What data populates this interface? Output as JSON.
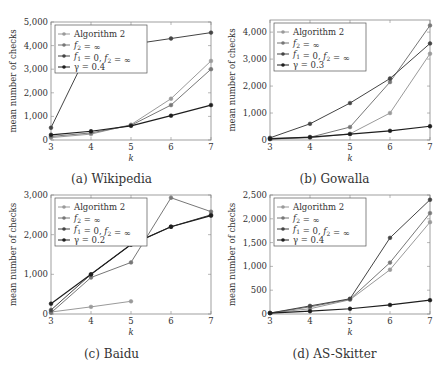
{
  "chart_data": [
    {
      "id": "a",
      "type": "line",
      "title": "(a) Wikipedia",
      "caption": "(a) Wikipedia",
      "xlabel": "k",
      "ylabel": "mean number of checks",
      "x": [
        3,
        4,
        5,
        6,
        7
      ],
      "xticks": [
        "3",
        "4",
        "5",
        "6",
        "7"
      ],
      "ylim": [
        0,
        5000
      ],
      "yticks": [
        0,
        1000,
        2000,
        3000,
        4000,
        5000
      ],
      "ytick_labels": [
        "0",
        "1,000",
        "2,000",
        "3,000",
        "4,000",
        "5,000"
      ],
      "legend_position": "upper left",
      "grid": false,
      "series": [
        {
          "name": "Algorithm 2",
          "color": "#9a9a9a",
          "values": [
            100,
            250,
            650,
            1750,
            3350
          ]
        },
        {
          "name": "f2 = ∞",
          "color": "#777777",
          "values": [
            150,
            300,
            620,
            1480,
            3000
          ]
        },
        {
          "name": "f1 = 0, f2 = ∞",
          "color": "#444444",
          "values": [
            520,
            4000,
            4050,
            4300,
            4550
          ]
        },
        {
          "name": "γ = 0.4",
          "color": "#1e1e1e",
          "values": [
            220,
            370,
            600,
            1030,
            1480
          ]
        }
      ]
    },
    {
      "id": "b",
      "type": "line",
      "title": "(b) Gowalla",
      "caption": "(b) Gowalla",
      "xlabel": "k",
      "ylabel": "mean number of checks",
      "x": [
        3,
        4,
        5,
        6,
        7
      ],
      "xticks": [
        "3",
        "4",
        "5",
        "6",
        "7"
      ],
      "ylim": [
        0,
        4450
      ],
      "yticks": [
        0,
        1000,
        2000,
        3000,
        4000
      ],
      "ytick_labels": [
        "0",
        "1,000",
        "2,000",
        "3,000",
        "4,000"
      ],
      "legend_position": "upper left",
      "grid": false,
      "series": [
        {
          "name": "Algorithm 2",
          "color": "#9a9a9a",
          "values": [
            30,
            80,
            230,
            1000,
            3200
          ]
        },
        {
          "name": "f2 = ∞",
          "color": "#777777",
          "values": [
            60,
            100,
            480,
            2150,
            4250
          ]
        },
        {
          "name": "f1 = 0, f2 = ∞",
          "color": "#444444",
          "values": [
            80,
            600,
            1370,
            2280,
            3580
          ]
        },
        {
          "name": "γ = 0.3",
          "color": "#1e1e1e",
          "values": [
            40,
            110,
            220,
            340,
            510
          ]
        }
      ]
    },
    {
      "id": "c",
      "type": "line",
      "title": "(c) Baidu",
      "caption": "(c) Baidu",
      "xlabel": "k",
      "ylabel": "mean number of checks",
      "x": [
        3,
        4,
        5,
        6,
        7
      ],
      "xticks": [
        "3",
        "4",
        "5",
        "6",
        "7"
      ],
      "ylim": [
        0,
        3000
      ],
      "yticks": [
        0,
        1000,
        2000,
        3000
      ],
      "ytick_labels": [
        "0",
        "1,000",
        "2,000",
        "3,000"
      ],
      "legend_position": "upper left",
      "grid": false,
      "series": [
        {
          "name": "Algorithm 2",
          "color": "#9a9a9a",
          "values": [
            50,
            180,
            320,
            null,
            null
          ]
        },
        {
          "name": "f2 = ∞",
          "color": "#777777",
          "values": [
            30,
            920,
            1300,
            2930,
            2580
          ]
        },
        {
          "name": "f1 = 0, f2 = ∞",
          "color": "#444444",
          "values": [
            100,
            1000,
            1750,
            2200,
            2500
          ]
        },
        {
          "name": "γ = 0.2",
          "color": "#1e1e1e",
          "values": [
            260,
            1000,
            1750,
            2200,
            2480
          ]
        }
      ]
    },
    {
      "id": "d",
      "type": "line",
      "title": "(d) AS-Skitter",
      "caption": "(d) AS-Skitter",
      "xlabel": "k",
      "ylabel": "mean number of checks",
      "x": [
        3,
        4,
        5,
        6,
        7
      ],
      "xticks": [
        "3",
        "4",
        "5",
        "6",
        "7"
      ],
      "ylim": [
        0,
        2500
      ],
      "yticks": [
        0,
        500,
        1000,
        1500,
        2000,
        2500
      ],
      "ytick_labels": [
        "0",
        "500",
        "1,000",
        "1,500",
        "2,000",
        "2,500"
      ],
      "legend_position": "upper left",
      "grid": false,
      "series": [
        {
          "name": "Algorithm 2",
          "color": "#9a9a9a",
          "values": [
            20,
            110,
            300,
            930,
            1930
          ]
        },
        {
          "name": "f2 = ∞",
          "color": "#777777",
          "values": [
            20,
            150,
            310,
            1080,
            2120
          ]
        },
        {
          "name": "f1 = 0, f2 = ∞",
          "color": "#444444",
          "values": [
            20,
            170,
            320,
            1600,
            2400
          ]
        },
        {
          "name": "γ = 0.4",
          "color": "#1e1e1e",
          "values": [
            20,
            60,
            110,
            190,
            290
          ]
        }
      ]
    }
  ],
  "layout": {
    "panels": [
      {
        "id": "a",
        "box": [
          51,
          22,
          211,
          140
        ],
        "caption_y": 172,
        "caption_x": 0
      },
      {
        "id": "b",
        "box": [
          270,
          20,
          430,
          140
        ],
        "caption_y": 172,
        "caption_x": 223
      },
      {
        "id": "c",
        "box": [
          51,
          195,
          211,
          314
        ],
        "caption_y": 347,
        "caption_x": 0
      },
      {
        "id": "d",
        "box": [
          270,
          195,
          430,
          314
        ],
        "caption_y": 347,
        "caption_x": 223
      }
    ]
  }
}
